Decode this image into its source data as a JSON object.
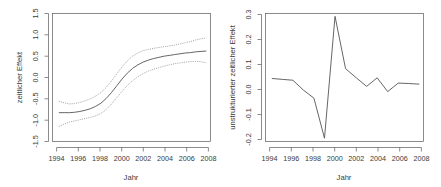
{
  "figure": {
    "background": "#ffffff",
    "line_color": "#4a4a4a",
    "band_color": "#8a8a8a",
    "axis_color": "#5a5a5a",
    "panel_count": 2
  },
  "chart_data": [
    {
      "id": "left",
      "type": "line",
      "title": "",
      "xlabel": "Jahr",
      "ylabel": "zeitlicher Effekt",
      "xlim": [
        1993.4,
        2008.4
      ],
      "ylim": [
        -1.62,
        1.62
      ],
      "xticks": [
        1994,
        1996,
        1998,
        2000,
        2002,
        2004,
        2006,
        2008
      ],
      "xtick_labels": [
        "1994",
        "1996",
        "1998",
        "2000",
        "2002",
        "2004",
        "2006",
        "2008"
      ],
      "yticks": [
        -1.5,
        -1.0,
        -0.5,
        0.0,
        0.5,
        1.0,
        1.5
      ],
      "ytick_labels": [
        "-1.5",
        "-1.0",
        "-0.5",
        "0.0",
        "0.5",
        "1.0",
        "1.5"
      ],
      "grid": false,
      "legend": null,
      "x": [
        1994,
        1994.5,
        1995,
        1995.5,
        1996,
        1996.5,
        1997,
        1997.5,
        1998,
        1998.5,
        1999,
        1999.5,
        2000,
        2000.5,
        2001,
        2001.5,
        2002,
        2002.5,
        2003,
        2003.5,
        2004,
        2004.5,
        2005,
        2005.5,
        2006,
        2006.5,
        2007,
        2007.5,
        2008
      ],
      "series": [
        {
          "name": "zeitlicher Effekt (Posterior-Mittelwert)",
          "style": "solid",
          "values": [
            -0.89,
            -0.89,
            -0.89,
            -0.88,
            -0.86,
            -0.83,
            -0.79,
            -0.73,
            -0.65,
            -0.53,
            -0.38,
            -0.21,
            -0.04,
            0.11,
            0.23,
            0.32,
            0.39,
            0.44,
            0.48,
            0.51,
            0.54,
            0.56,
            0.58,
            0.6,
            0.62,
            0.63,
            0.65,
            0.66,
            0.67
          ]
        },
        {
          "name": "oberes 95%-Kredibilitätsband",
          "style": "dotted",
          "values": [
            -0.6,
            -0.64,
            -0.67,
            -0.66,
            -0.63,
            -0.59,
            -0.54,
            -0.47,
            -0.38,
            -0.25,
            -0.09,
            0.09,
            0.27,
            0.42,
            0.54,
            0.62,
            0.68,
            0.71,
            0.74,
            0.76,
            0.78,
            0.8,
            0.82,
            0.85,
            0.88,
            0.91,
            0.95,
            0.98,
            1.0
          ]
        },
        {
          "name": "unteres 95%-Kredibilitätsband",
          "style": "dotted",
          "values": [
            -1.24,
            -1.18,
            -1.13,
            -1.1,
            -1.07,
            -1.04,
            -1.01,
            -0.97,
            -0.91,
            -0.81,
            -0.67,
            -0.51,
            -0.35,
            -0.2,
            -0.08,
            0.02,
            0.1,
            0.16,
            0.21,
            0.25,
            0.29,
            0.32,
            0.35,
            0.37,
            0.39,
            0.4,
            0.41,
            0.4,
            0.37
          ]
        }
      ]
    },
    {
      "id": "right",
      "type": "line",
      "title": "",
      "xlabel": "Jahr",
      "ylabel": "unstrukturierter zeitlicher Effekt",
      "xlim": [
        1993.4,
        2008.4
      ],
      "ylim": [
        -0.27,
        0.315
      ],
      "xticks": [
        1994,
        1996,
        1998,
        2000,
        2002,
        2004,
        2006,
        2008
      ],
      "xtick_labels": [
        "1994",
        "1996",
        "1998",
        "2000",
        "2002",
        "2004",
        "2006",
        "2008"
      ],
      "yticks": [
        -0.2,
        -0.1,
        0.0,
        0.1,
        0.2,
        0.3
      ],
      "ytick_labels": [
        "-0.2",
        "-0.1",
        "0.0",
        "0.1",
        "0.2",
        "0.3"
      ],
      "grid": false,
      "legend": null,
      "x": [
        1994,
        1995,
        1996,
        1997,
        1998,
        1999,
        2000,
        2001,
        2002,
        2003,
        2004,
        2005,
        2006,
        2007,
        2008
      ],
      "series": [
        {
          "name": "unstrukturierter zeitlicher Effekt",
          "style": "solid",
          "values": [
            0.018,
            0.014,
            0.01,
            -0.035,
            -0.072,
            -0.255,
            0.302,
            0.063,
            0.022,
            -0.018,
            0.021,
            -0.042,
            -0.003,
            -0.005,
            -0.008
          ]
        }
      ]
    }
  ]
}
